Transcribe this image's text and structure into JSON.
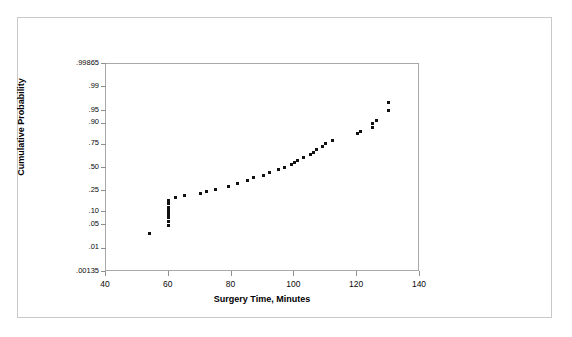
{
  "chart_data": {
    "type": "scatter",
    "title": "",
    "subtitle": "",
    "xlabel": "Surgery Time, Minutes",
    "ylabel": "Cumulative Probability",
    "plot_kind": "normal-probability-plot",
    "xlim": [
      40,
      140
    ],
    "xticks": [
      40,
      60,
      80,
      100,
      120,
      140
    ],
    "xticklabels": [
      "40",
      "60",
      "80",
      "100",
      "120",
      "140"
    ],
    "ylim_prob": [
      0.00135,
      0.99865
    ],
    "yticks": [
      0.00135,
      0.01,
      0.05,
      0.1,
      0.25,
      0.5,
      0.75,
      0.9,
      0.95,
      0.99,
      0.99865
    ],
    "yticklabels": [
      ".00135",
      ".01",
      ".05",
      ".10",
      ".25",
      ".50",
      ".75",
      ".90",
      ".95",
      ".99",
      ".99865"
    ],
    "grid": false,
    "legend": null,
    "marker": "square",
    "marker_color": "#111111",
    "series": [
      {
        "name": "Surgery Time",
        "x": [
          54,
          60,
          60,
          60,
          60,
          60,
          60,
          60,
          60,
          60,
          62,
          65,
          70,
          72,
          75,
          79,
          82,
          85,
          87,
          90,
          92,
          95,
          97,
          99,
          100,
          101,
          103,
          105,
          106,
          107,
          109,
          110,
          112,
          120,
          121,
          125,
          125,
          126,
          130,
          130
        ],
        "y": [
          0.03,
          0.05,
          0.062,
          0.075,
          0.088,
          0.1,
          0.115,
          0.13,
          0.15,
          0.175,
          0.2,
          0.215,
          0.23,
          0.245,
          0.27,
          0.3,
          0.33,
          0.36,
          0.39,
          0.42,
          0.45,
          0.48,
          0.51,
          0.54,
          0.565,
          0.59,
          0.62,
          0.65,
          0.67,
          0.7,
          0.73,
          0.76,
          0.79,
          0.84,
          0.855,
          0.88,
          0.9,
          0.915,
          0.95,
          0.97
        ]
      }
    ],
    "n_points": 40,
    "axis_color": "#8f8f8f",
    "frame_color": "#a8a8a8",
    "background": "#ffffff"
  },
  "page": {
    "outer_border_color": "#c9c9c9"
  }
}
